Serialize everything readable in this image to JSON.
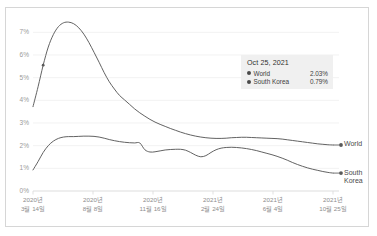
{
  "chart_data": {
    "type": "line",
    "title": "",
    "xlabel": "",
    "ylabel": "",
    "ylim": [
      0,
      7.5
    ],
    "grid": true,
    "legend_position": "right-of-plot",
    "y_ticks": [
      "0%",
      "1%",
      "2%",
      "3%",
      "4%",
      "5%",
      "6%",
      "7%"
    ],
    "y_tick_values": [
      0,
      1,
      2,
      3,
      4,
      5,
      6,
      7
    ],
    "x_ticks": [
      {
        "line1": "2020년",
        "line2": "3월 14일"
      },
      {
        "line1": "2020년",
        "line2": "8월 8일"
      },
      {
        "line1": "2020년",
        "line2": "11월 16일"
      },
      {
        "line1": "2021년",
        "line2": "2월 24일"
      },
      {
        "line1": "2021년",
        "line2": "6월 4일"
      },
      {
        "line1": "2021년",
        "line2": "10월 25일"
      }
    ],
    "series": [
      {
        "name": "World",
        "color": "#5a5a5a",
        "end_label_line1": "World",
        "end_label_line2": "",
        "values": [
          3.72,
          4.6,
          5.55,
          6.35,
          6.9,
          7.25,
          7.42,
          7.45,
          7.38,
          7.2,
          6.92,
          6.55,
          6.12,
          5.68,
          5.22,
          4.82,
          4.5,
          4.22,
          4.02,
          3.82,
          3.62,
          3.45,
          3.3,
          3.16,
          3.04,
          2.94,
          2.85,
          2.76,
          2.68,
          2.6,
          2.53,
          2.47,
          2.42,
          2.38,
          2.35,
          2.33,
          2.32,
          2.32,
          2.33,
          2.35,
          2.36,
          2.37,
          2.37,
          2.36,
          2.35,
          2.34,
          2.33,
          2.32,
          2.31,
          2.29,
          2.26,
          2.23,
          2.2,
          2.17,
          2.14,
          2.11,
          2.08,
          2.06,
          2.04,
          2.03
        ]
      },
      {
        "name": "South Korea",
        "color": "#5a5a5a",
        "end_label_line1": "South",
        "end_label_line2": "Korea",
        "values": [
          0.93,
          1.3,
          1.7,
          2.0,
          2.2,
          2.32,
          2.38,
          2.4,
          2.4,
          2.41,
          2.42,
          2.42,
          2.41,
          2.38,
          2.33,
          2.27,
          2.22,
          2.18,
          2.15,
          2.13,
          2.12,
          2.12,
          1.82,
          1.72,
          1.73,
          1.77,
          1.81,
          1.83,
          1.84,
          1.84,
          1.8,
          1.7,
          1.58,
          1.51,
          1.56,
          1.7,
          1.82,
          1.89,
          1.92,
          1.93,
          1.92,
          1.9,
          1.87,
          1.83,
          1.78,
          1.72,
          1.66,
          1.6,
          1.53,
          1.45,
          1.36,
          1.26,
          1.17,
          1.09,
          1.02,
          0.96,
          0.91,
          0.86,
          0.82,
          0.79
        ]
      }
    ],
    "tooltip": {
      "title": "Oct 25, 2021",
      "rows": [
        {
          "name": "World",
          "value": "2.03%",
          "dot_color": "#4a4a4a"
        },
        {
          "name": "South Korea",
          "value": "0.79%",
          "dot_color": "#4a4a4a"
        }
      ]
    },
    "markers": [
      {
        "series": "World",
        "label": "end-point-world"
      },
      {
        "series": "South Korea",
        "label": "end-point-south-korea"
      },
      {
        "series": "World",
        "label": "peak-marker-world"
      }
    ]
  },
  "colors": {
    "line": "#5a5a5a",
    "grid": "#ececec",
    "axis": "#d9d9d9",
    "frame": "#d6d6d6",
    "tooltip_bg": "#f0f0f0",
    "tick_text": "#9a9a9a"
  }
}
